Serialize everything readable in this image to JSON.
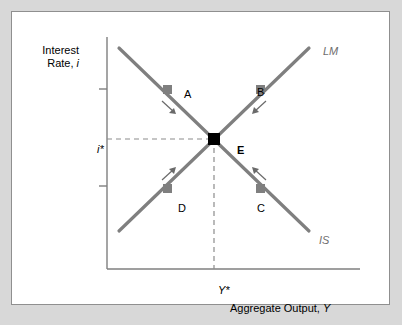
{
  "figure": {
    "kind": "is-lm-diagram",
    "background_color": "#d8d8d8",
    "panel_color": "#ffffff",
    "panel_border_color": "#8f8f8f",
    "curve_color": "#7f7f7f",
    "marker_color": "#7f7f7f",
    "equilibrium_color": "#000000",
    "axis_color": "#7f7f7f",
    "guide_color": "#9a9a9a"
  },
  "axes": {
    "y_label_line1": "Interest",
    "y_label_line2": "Rate, i",
    "y_label_variable": "i",
    "x_label": "Aggregate Output, Y",
    "x_label_variable": "Y",
    "y_equilibrium_tick": "i*",
    "x_equilibrium_tick": "Y*"
  },
  "curves": [
    {
      "name": "LM",
      "label": "LM",
      "slope": "upward",
      "description": "Money market equilibrium curve, slopes up to the right"
    },
    {
      "name": "IS",
      "label": "IS",
      "slope": "downward",
      "description": "Goods market equilibrium curve, slopes down to the right"
    }
  ],
  "points": [
    {
      "label": "A",
      "curve": "IS",
      "position": "upper-left",
      "marker": "square-gray"
    },
    {
      "label": "B",
      "curve": "LM",
      "position": "upper-right",
      "marker": "square-gray"
    },
    {
      "label": "C",
      "curve": "IS",
      "position": "lower-right",
      "marker": "square-gray"
    },
    {
      "label": "D",
      "curve": "LM",
      "position": "lower-left",
      "marker": "square-gray"
    },
    {
      "label": "E",
      "curve": "IS-LM intersection",
      "position": "center",
      "marker": "square-black"
    }
  ],
  "arrows": [
    {
      "near_point": "A",
      "direction": "down-right",
      "meaning": "adjustment toward equilibrium"
    },
    {
      "near_point": "B",
      "direction": "down-left",
      "meaning": "adjustment toward equilibrium"
    },
    {
      "near_point": "C",
      "direction": "up-left",
      "meaning": "adjustment toward equilibrium"
    },
    {
      "near_point": "D",
      "direction": "up-right",
      "meaning": "adjustment toward equilibrium"
    }
  ],
  "chart_data": {
    "type": "line",
    "title": "",
    "xlabel": "Aggregate Output, Y",
    "ylabel": "Interest Rate, i",
    "xlim": [
      0,
      100
    ],
    "ylim": [
      0,
      100
    ],
    "grid": false,
    "legend": "inline-curve-labels",
    "series": [
      {
        "name": "LM",
        "x": [
          12,
          100
        ],
        "y": [
          14,
          100
        ],
        "style": "solid",
        "color": "#7f7f7f"
      },
      {
        "name": "IS",
        "x": [
          12,
          100
        ],
        "y": [
          100,
          14
        ],
        "style": "solid",
        "color": "#7f7f7f"
      }
    ],
    "annotations": [
      {
        "text": "A",
        "x": 36,
        "y": 74,
        "on": "IS"
      },
      {
        "text": "B",
        "x": 74,
        "y": 74,
        "on": "LM"
      },
      {
        "text": "C",
        "x": 74,
        "y": 36,
        "on": "IS"
      },
      {
        "text": "D",
        "x": 36,
        "y": 36,
        "on": "LM"
      },
      {
        "text": "E",
        "x": 55,
        "y": 55,
        "on": "intersection"
      },
      {
        "text": "i*",
        "x": 0,
        "y": 55,
        "on": "y-axis"
      },
      {
        "text": "Y*",
        "x": 55,
        "y": 0,
        "on": "x-axis"
      }
    ]
  }
}
